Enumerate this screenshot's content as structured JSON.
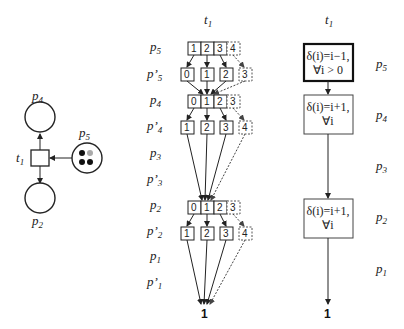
{
  "petri_net": {
    "transition": "t",
    "transition_sub": "1",
    "places": [
      {
        "name": "p",
        "sub": "4"
      },
      {
        "name": "p",
        "sub": "5"
      },
      {
        "name": "p",
        "sub": "2"
      }
    ],
    "p5_tokens": 4
  },
  "middle": {
    "title": "t",
    "title_sub": "1",
    "row_labels": [
      {
        "name": "p",
        "sub": "5"
      },
      {
        "name": "p’",
        "sub": "5"
      },
      {
        "name": "p",
        "sub": "4"
      },
      {
        "name": "p’",
        "sub": "4"
      },
      {
        "name": "p",
        "sub": "3"
      },
      {
        "name": "p’",
        "sub": "3"
      },
      {
        "name": "p",
        "sub": "2"
      },
      {
        "name": "p’",
        "sub": "2"
      },
      {
        "name": "p",
        "sub": "1"
      },
      {
        "name": "p’",
        "sub": "1"
      }
    ],
    "p5_values": [
      "1",
      "2",
      "3",
      "4"
    ],
    "p5p_values": [
      "0",
      "1",
      "2",
      "3"
    ],
    "p4_values": [
      "0",
      "1",
      "2",
      "3"
    ],
    "p4p_values": [
      "1",
      "2",
      "3",
      "4"
    ],
    "p2_values": [
      "0",
      "1",
      "2",
      "3"
    ],
    "p2p_values": [
      "1",
      "2",
      "3",
      "4"
    ],
    "final": "1"
  },
  "right": {
    "title": "t",
    "title_sub": "1",
    "boxes": [
      {
        "line1": "δ(i)=i−1,",
        "line2": "∀i > 0"
      },
      {
        "line1": "δ(i)=i+1,",
        "line2": "∀i"
      },
      {
        "line1": "δ(i)=i+1,",
        "line2": "∀i"
      }
    ],
    "row_labels": [
      {
        "name": "p",
        "sub": "5"
      },
      {
        "name": "p",
        "sub": "4"
      },
      {
        "name": "p",
        "sub": "3"
      },
      {
        "name": "p",
        "sub": "2"
      },
      {
        "name": "p",
        "sub": "1"
      }
    ],
    "final": "1"
  }
}
